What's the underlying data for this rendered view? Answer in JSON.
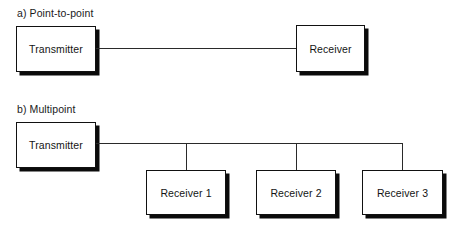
{
  "figure": {
    "background_color": "#ffffff",
    "line_color": "#2a2a2a",
    "box_border_color": "#111111",
    "box_shadow_color": "#0b0b0b"
  },
  "panels": [
    {
      "id": "point-to-point",
      "label": "a) Point-to-point",
      "nodes": [
        {
          "id": "transmitter-a",
          "label": "Transmitter"
        },
        {
          "id": "receiver-a",
          "label": "Receiver"
        }
      ]
    },
    {
      "id": "multipoint",
      "label": "b) Multipoint",
      "nodes": [
        {
          "id": "transmitter-b",
          "label": "Transmitter"
        },
        {
          "id": "receiver-1",
          "label": "Receiver 1"
        },
        {
          "id": "receiver-2",
          "label": "Receiver 2"
        },
        {
          "id": "receiver-3",
          "label": "Receiver 3"
        }
      ]
    }
  ]
}
